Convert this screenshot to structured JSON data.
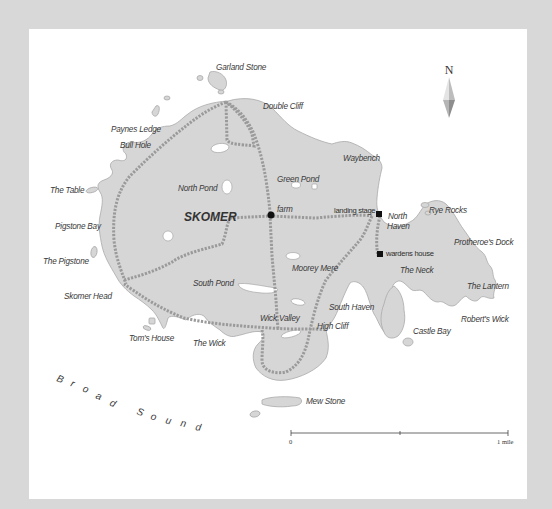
{
  "map": {
    "title": "SKOMER",
    "colors": {
      "border": "#d8d8d8",
      "sea": "#ffffff",
      "land": "#d6d6d6",
      "coast": "#a9a9a9",
      "path": "#9a9a9a",
      "text": "#3a3a3a",
      "marker": "#111111"
    },
    "north_arrow": {
      "label": "N"
    },
    "scale_bar": {
      "start_label": "0",
      "end_label": "1 mile"
    },
    "sea_label": {
      "text": "Broad Sound",
      "letters": [
        {
          "ch": "B",
          "x": 56,
          "y": 381,
          "rot": 20
        },
        {
          "ch": "r",
          "x": 70,
          "y": 386,
          "rot": 20
        },
        {
          "ch": "o",
          "x": 82,
          "y": 391,
          "rot": 22
        },
        {
          "ch": "a",
          "x": 95,
          "y": 398,
          "rot": 24
        },
        {
          "ch": "d",
          "x": 109,
          "y": 405,
          "rot": 26
        },
        {
          "ch": "S",
          "x": 136,
          "y": 414,
          "rot": 20
        },
        {
          "ch": "o",
          "x": 150,
          "y": 419,
          "rot": 18
        },
        {
          "ch": "u",
          "x": 165,
          "y": 423,
          "rot": 15
        },
        {
          "ch": "n",
          "x": 180,
          "y": 426,
          "rot": 12
        },
        {
          "ch": "d",
          "x": 195,
          "y": 430,
          "rot": 10
        }
      ]
    },
    "labels": {
      "garland_stone": "Garland Stone",
      "double_cliff": "Double Cliff",
      "paynes_ledge": "Paynes Ledge",
      "bull_hole": "Bull Hole",
      "waybench": "Waybench",
      "green_pond": "Green Pond",
      "north_pond": "North Pond",
      "the_table": "The Table",
      "farm": "farm",
      "landing_stage": "landing stage",
      "north_haven_1": "North",
      "north_haven_2": "Haven",
      "rye_rocks": "Rye Rocks",
      "pigstone_bay": "Pigstone Bay",
      "wardens_house": "wardens house",
      "protheroes_dock": "Protheroe's Dock",
      "the_pigstone": "The Pigstone",
      "moorey_mere": "Moorey Mere",
      "the_neck": "The Neck",
      "south_pond": "South Pond",
      "the_lantern": "The Lantern",
      "skomer_head": "Skomer Head",
      "south_haven": "South Haven",
      "roberts_wick": "Robert's Wick",
      "wick_valley": "Wick Valley",
      "high_cliff": "High Cliff",
      "toms_house": "Tom's House",
      "the_wick": "The Wick",
      "castle_bay": "Castle Bay",
      "mew_stone": "Mew Stone"
    }
  }
}
